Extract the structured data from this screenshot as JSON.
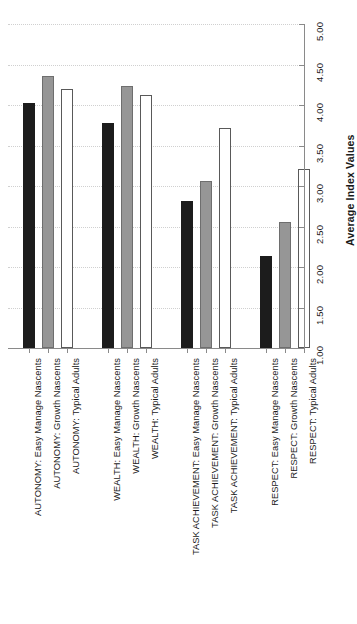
{
  "chart_data": {
    "type": "bar",
    "title": "",
    "subtitle": "",
    "xlabel": "",
    "ylabel": "Average Index Values",
    "ylim": [
      1.0,
      5.0
    ],
    "ytick_labels": [
      "1.00",
      "1.50",
      "2.00",
      "2.50",
      "3.00",
      "3.50",
      "4.00",
      "4.50",
      "5.00"
    ],
    "ytick_values": [
      1.0,
      1.5,
      2.0,
      2.5,
      3.0,
      3.5,
      4.0,
      4.5,
      5.0
    ],
    "grid": true,
    "grid_axis": "y",
    "legend": false,
    "orientation": "vertical",
    "axis_position": "right",
    "tick_label_rotation": -90,
    "categories": [
      "AUTONOMY: Easy Manage Nascents",
      "AUTONOMY: Growth Nascents",
      "AUTONOMY: Typical Adults",
      "WEALTH: Easy Manage Nascents",
      "WEALTH: Growth Nascents",
      "WEALTH: Typical Adults",
      "TASK ACHIEVEMENT: Easy Manage Nascents",
      "TASK ACHIEVEMENT: Growth Nascents",
      "TASK ACHIEVEMENT: Typical Adults",
      "RESPECT: Easy Manage Nascents",
      "RESPECT: Growth Nascents",
      "RESPECT: Typical Adults"
    ],
    "values": [
      4.03,
      4.36,
      4.2,
      3.78,
      4.23,
      4.12,
      2.81,
      3.06,
      3.72,
      2.14,
      2.55,
      3.21
    ],
    "bar_styles": [
      "black",
      "gray",
      "white",
      "black",
      "gray",
      "white",
      "black",
      "gray",
      "white",
      "black",
      "gray",
      "white"
    ],
    "groups": [
      {
        "name": "AUTONOMY",
        "series": [
          "Easy Manage Nascents",
          "Growth Nascents",
          "Typical Adults"
        ],
        "values": [
          4.03,
          4.36,
          4.2
        ]
      },
      {
        "name": "WEALTH",
        "series": [
          "Easy Manage Nascents",
          "Growth Nascents",
          "Typical Adults"
        ],
        "values": [
          3.78,
          4.23,
          4.12
        ]
      },
      {
        "name": "TASK ACHIEVEMENT",
        "series": [
          "Easy Manage Nascents",
          "Growth Nascents",
          "Typical Adults"
        ],
        "values": [
          2.81,
          3.06,
          3.72
        ]
      },
      {
        "name": "RESPECT",
        "series": [
          "Easy Manage Nascents",
          "Growth Nascents",
          "Typical Adults"
        ],
        "values": [
          2.14,
          2.55,
          3.21
        ]
      }
    ],
    "colors": {
      "black_bar": "#1c1c1c",
      "gray_bar": "#969696",
      "white_bar": "#ffffff",
      "bar_edge": "#595959",
      "gridline": "#d0d0d0",
      "axis": "#8a8a8a",
      "text": "#1a1a1a",
      "background": "#ffffff"
    }
  }
}
